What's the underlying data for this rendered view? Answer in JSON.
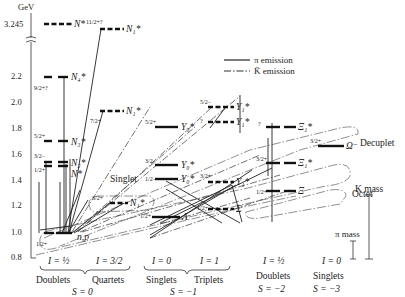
{
  "axis": {
    "unit": "GeV",
    "ticks": [
      "3.245",
      "2.2",
      "2.0",
      "1.8",
      "1.6",
      "1.4",
      "1.2",
      "1.0",
      "0.8"
    ]
  },
  "legend": {
    "pi": "π emission",
    "kbar": "K̄ emission"
  },
  "levels": {
    "nstar": "N*",
    "n4": "N₄*",
    "n3": "N₃*",
    "n2": "N₂*",
    "n1": "N*",
    "n_high": "N₁*",
    "n_mid": "N₁*",
    "n_low": "N₁*",
    "np": "n,p",
    "y0a": "Y₀*",
    "y0b": "Y₀*",
    "y0c": "Y₀*",
    "y1a": "Y₁*",
    "y1b": "Y₁*",
    "y1c": "Y₁*",
    "lambda": "Λ",
    "sigma": "Σ",
    "xi_a": "Ξ₁*",
    "xi_b": "Ξ₁*",
    "xi": "Ξ",
    "omega": "Ω⁻"
  },
  "spins": {
    "n4": "9/2+?",
    "n3": "5/2+",
    "n2": "3/2−",
    "n1": "1/2+",
    "n_high": "11/2+?",
    "n_mid": "7/2+",
    "n_low": "3/2+",
    "np": "1/2+",
    "y0a": "5/2+",
    "y0b": "3/2−",
    "y0c": "1/2−",
    "y1a": "5/2−",
    "y1b": "?",
    "y1c": "3/2+",
    "lambda": "1/2+",
    "sigma": "1/2+",
    "xi_a": "?",
    "xi_b": "3/2+",
    "xi": "1/2+",
    "omega": "3/2+"
  },
  "annotations": {
    "singlet": "Singlet",
    "octet": "Octet",
    "decuplet": "Decuplet",
    "k_mass": "K mass",
    "pi_mass": "π mass"
  },
  "groups": {
    "s0": {
      "i1": "I = ½",
      "i2": "I = 3/2",
      "g1": "Doublets",
      "g2": "Quartets",
      "s": "S = 0"
    },
    "s1": {
      "i1": "I = 0",
      "i2": "I = 1",
      "g1": "Singlets",
      "g2": "Triplets",
      "s": "S = −1"
    },
    "s2": {
      "i1": "I = ½",
      "g1": "Doublets",
      "s": "S = −2"
    },
    "s3": {
      "i1": "I = 0",
      "g1": "Singlets",
      "s": "S = −3"
    }
  }
}
